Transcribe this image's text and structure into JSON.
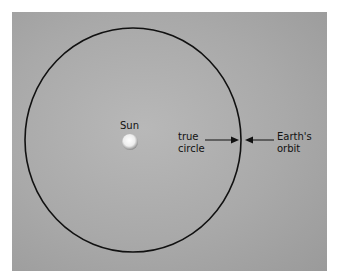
{
  "diagram": {
    "sun_label": "Sun",
    "true_circle_label_line1": "true",
    "true_circle_label_line2": "circle",
    "orbit_label_line1": "Earth's",
    "orbit_label_line2": "orbit",
    "colors": {
      "background": "#a9a9a9",
      "line": "#000000",
      "sun": "#ffffff"
    }
  }
}
